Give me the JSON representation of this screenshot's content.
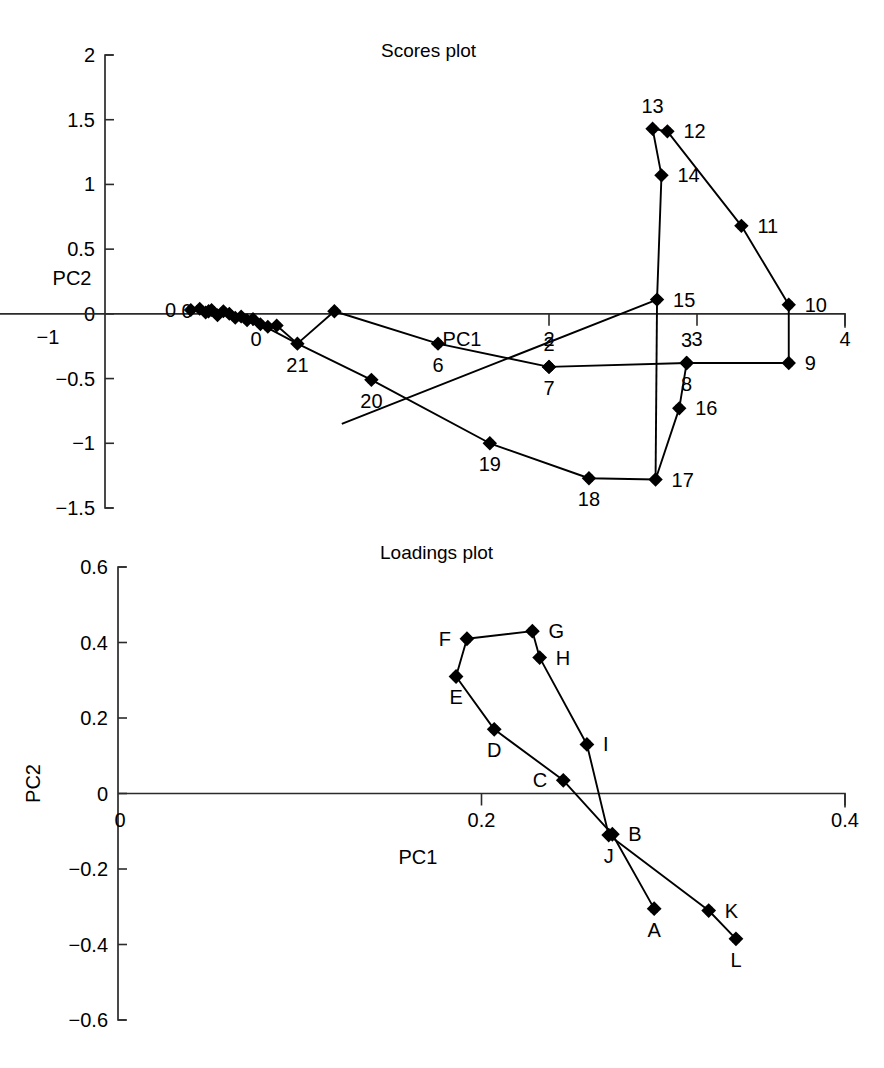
{
  "figure": {
    "panels": [
      "Scores plot",
      "Loadings plot"
    ]
  },
  "scores": {
    "title": "Scores plot",
    "xlabel": "PC1",
    "ylabel": "PC2",
    "xticks": [
      "-1",
      "0",
      "2",
      "3",
      "4"
    ],
    "yticks": [
      "2",
      "1.5",
      "1",
      "0.5",
      "0",
      "-0.5",
      "-1",
      "-1.5"
    ]
  },
  "loadings": {
    "title": "Loadings plot",
    "xlabel": "PC1",
    "ylabel": "PC2",
    "xticks": [
      "0",
      "0.2",
      "0.4"
    ],
    "yticks": [
      "0.6",
      "0.4",
      "0.2",
      "0",
      "-0.2",
      "-0.4",
      "-0.6"
    ]
  },
  "chart_data": [
    {
      "type": "scatter",
      "title": "Scores plot",
      "xlabel": "PC1",
      "ylabel": "PC2",
      "xlim": [
        -1,
        4
      ],
      "ylim": [
        -1.5,
        2
      ],
      "xticks": [
        -1,
        0,
        2,
        3,
        4
      ],
      "yticks": [
        2,
        1.5,
        1,
        0.5,
        0,
        -0.5,
        -1,
        -1.5
      ],
      "grid": false,
      "legend": false,
      "connected": true,
      "marker": "filled-diamond",
      "points": [
        {
          "label": "0",
          "x": -0.3,
          "y": 0.02,
          "label_pos": "left"
        },
        {
          "label": "1",
          "x": -0.18,
          "y": 0.03,
          "label_pos": "none"
        },
        {
          "label": "2",
          "x": 2.0,
          "y": -0.41,
          "label_pos": "above"
        },
        {
          "label": "3",
          "x": 2.93,
          "y": -0.38,
          "label_pos": "above"
        },
        {
          "label": "4",
          "x": -0.14,
          "y": 0.0,
          "label_pos": "none"
        },
        {
          "label": "5",
          "x": -0.05,
          "y": -0.07,
          "label_pos": "none"
        },
        {
          "label": "6",
          "x": 1.25,
          "y": -0.23,
          "label_pos": "below"
        },
        {
          "label": "7",
          "x": 2.0,
          "y": -0.41,
          "label_pos": "below"
        },
        {
          "label": "8",
          "x": 2.93,
          "y": -0.38,
          "label_pos": "below"
        },
        {
          "label": "9",
          "x": 3.62,
          "y": -0.38,
          "label_pos": "right"
        },
        {
          "label": "10",
          "x": 3.62,
          "y": 0.07,
          "label_pos": "right"
        },
        {
          "label": "11",
          "x": 3.3,
          "y": 0.68,
          "label_pos": "right"
        },
        {
          "label": "12",
          "x": 2.8,
          "y": 1.41,
          "label_pos": "right"
        },
        {
          "label": "13",
          "x": 2.7,
          "y": 1.43,
          "label_pos": "above"
        },
        {
          "label": "14",
          "x": 2.76,
          "y": 1.07,
          "label_pos": "right"
        },
        {
          "label": "15",
          "x": 2.73,
          "y": 0.11,
          "label_pos": "right"
        },
        {
          "label": "16",
          "x": 2.88,
          "y": -0.73,
          "label_pos": "right"
        },
        {
          "label": "17",
          "x": 2.72,
          "y": -1.28,
          "label_pos": "right"
        },
        {
          "label": "18",
          "x": 2.27,
          "y": -1.27,
          "label_pos": "below"
        },
        {
          "label": "19",
          "x": 1.6,
          "y": -1.0,
          "label_pos": "below"
        },
        {
          "label": "20",
          "x": 0.8,
          "y": -0.51,
          "label_pos": "below"
        },
        {
          "label": "21",
          "x": 0.3,
          "y": -0.23,
          "label_pos": "below"
        }
      ],
      "cluster_points": [
        {
          "x": -0.42,
          "y": 0.03
        },
        {
          "x": -0.36,
          "y": 0.04
        },
        {
          "x": -0.32,
          "y": 0.01
        },
        {
          "x": -0.28,
          "y": 0.03
        },
        {
          "x": -0.24,
          "y": -0.01
        },
        {
          "x": -0.2,
          "y": 0.02
        },
        {
          "x": -0.16,
          "y": 0.0
        },
        {
          "x": -0.12,
          "y": -0.03
        },
        {
          "x": -0.08,
          "y": -0.02
        },
        {
          "x": -0.04,
          "y": -0.05
        },
        {
          "x": 0.0,
          "y": -0.04
        },
        {
          "x": 0.05,
          "y": -0.08
        },
        {
          "x": 0.1,
          "y": -0.1
        },
        {
          "x": 0.16,
          "y": -0.09
        }
      ],
      "path_upper": [
        "0c",
        "21",
        "15",
        "14",
        "13",
        "12",
        "11",
        "10",
        "9",
        "8",
        "7",
        "6",
        "21b"
      ],
      "annotation": "Closed trajectory of 22 time-ordered samples (0-21) in PC1/PC2 space"
    },
    {
      "type": "scatter",
      "title": "Loadings plot",
      "xlabel": "PC1",
      "ylabel": "PC2",
      "xlim": [
        0,
        0.4
      ],
      "ylim": [
        -0.6,
        0.6
      ],
      "xticks": [
        0,
        0.2,
        0.4
      ],
      "yticks": [
        0.6,
        0.4,
        0.2,
        0,
        -0.2,
        -0.4,
        -0.6
      ],
      "grid": false,
      "legend": false,
      "connected": true,
      "marker": "filled-diamond",
      "points": [
        {
          "label": "A",
          "x": 0.295,
          "y": -0.305,
          "label_pos": "below"
        },
        {
          "label": "B",
          "x": 0.272,
          "y": -0.108,
          "label_pos": "right"
        },
        {
          "label": "C",
          "x": 0.245,
          "y": 0.035,
          "label_pos": "left"
        },
        {
          "label": "D",
          "x": 0.207,
          "y": 0.17,
          "label_pos": "below"
        },
        {
          "label": "E",
          "x": 0.186,
          "y": 0.31,
          "label_pos": "below"
        },
        {
          "label": "F",
          "x": 0.192,
          "y": 0.41,
          "label_pos": "left"
        },
        {
          "label": "G",
          "x": 0.228,
          "y": 0.43,
          "label_pos": "right"
        },
        {
          "label": "H",
          "x": 0.232,
          "y": 0.36,
          "label_pos": "right"
        },
        {
          "label": "I",
          "x": 0.258,
          "y": 0.13,
          "label_pos": "right"
        },
        {
          "label": "J",
          "x": 0.27,
          "y": -0.11,
          "label_pos": "below"
        },
        {
          "label": "K",
          "x": 0.325,
          "y": -0.31,
          "label_pos": "right"
        },
        {
          "label": "L",
          "x": 0.34,
          "y": -0.385,
          "label_pos": "below"
        }
      ],
      "chains": [
        [
          "F",
          "E",
          "D",
          "C",
          "B",
          "A"
        ],
        [
          "F",
          "G",
          "H",
          "I",
          "J",
          "K",
          "L"
        ]
      ],
      "annotation": "Variable loadings A-L forming two converging chains meeting near J/B"
    }
  ]
}
